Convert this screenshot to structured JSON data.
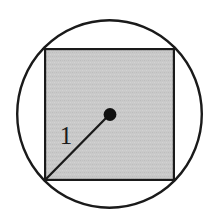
{
  "figure": {
    "name": "circle-with-inscribed-square",
    "background_color": "#ffffff",
    "labels": {
      "radius": "1"
    },
    "colors": {
      "stroke": "#1a1a1a",
      "square_fill": "#c6c6c6",
      "dot_fill": "#111111",
      "label_color": "#1a1a1a"
    },
    "geometry": {
      "circle": {
        "cx": 109.5,
        "cy": 114,
        "rx": 93.5,
        "ry": 95,
        "stroke_width": 2.4
      },
      "square": {
        "x": 44,
        "y": 48,
        "width": 131,
        "height": 133,
        "stroke_width": 2.2
      },
      "radius_line": {
        "x1": 44,
        "y1": 181,
        "x2": 109.5,
        "y2": 114.5,
        "stroke_width": 2.2
      },
      "center_dot": {
        "cx": 110,
        "cy": 114.5,
        "r": 6.4
      },
      "radius_label_position": {
        "x": 66,
        "y": 144
      }
    }
  }
}
